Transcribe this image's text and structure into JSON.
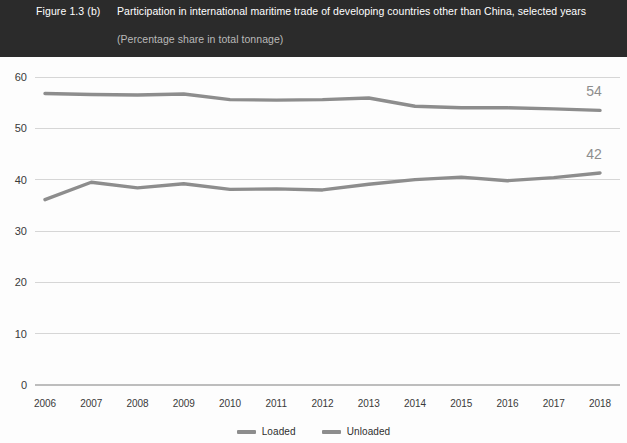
{
  "header": {
    "figure_number": "Figure 1.3 (b)",
    "title": "Participation in international maritime trade of developing countries other than China, selected years",
    "subtitle": "(Percentage share in total tonnage)",
    "background_color": "#2b2b2b",
    "text_color": "#ffffff",
    "subtitle_color": "#b9b9b9"
  },
  "legend": {
    "position": "bottom-center",
    "items": [
      {
        "label": "Loaded",
        "color": "#8d8d8d"
      },
      {
        "label": "Unloaded",
        "color": "#8d8d8d"
      }
    ]
  },
  "chart_data": {
    "type": "line",
    "title": "Participation in international maritime trade of developing countries other than China, selected years",
    "subtitle": "(Percentage share in total tonnage)",
    "xlabel": "",
    "ylabel": "",
    "ylim": [
      0,
      60
    ],
    "yticks": [
      0,
      10,
      20,
      30,
      40,
      50,
      60
    ],
    "grid": true,
    "legend_position": "bottom",
    "categories": [
      "2006",
      "2007",
      "2008",
      "2009",
      "2010",
      "2011",
      "2012",
      "2013",
      "2014",
      "2015",
      "2016",
      "2017",
      "2018"
    ],
    "series": [
      {
        "name": "Loaded",
        "color": "#8d8d8d",
        "values": [
          56.8,
          56.6,
          56.5,
          56.7,
          55.6,
          55.5,
          55.6,
          55.9,
          54.3,
          54.0,
          54.0,
          53.8,
          53.5
        ],
        "end_label": "54"
      },
      {
        "name": "Unloaded",
        "color": "#8d8d8d",
        "values": [
          36.1,
          39.5,
          38.4,
          39.2,
          38.1,
          38.2,
          38.0,
          39.1,
          40.0,
          40.5,
          39.8,
          40.4,
          41.3
        ],
        "end_label": "42"
      }
    ],
    "annotations": [
      {
        "text": "54",
        "series": "Loaded",
        "at_category": "2018"
      },
      {
        "text": "42",
        "series": "Unloaded",
        "at_category": "2018"
      }
    ]
  },
  "colors": {
    "plot_background": "#fdfdfd",
    "gridline": "#d6d6d6",
    "baseline": "#bdbdbd",
    "tick_text": "#3a3a3a",
    "series_line": "#8d8d8d"
  }
}
